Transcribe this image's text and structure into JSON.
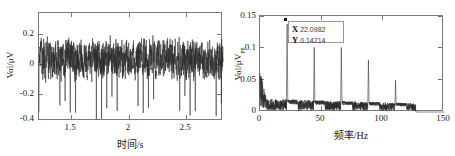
{
  "figure": {
    "background": "#ffffff",
    "trace_color": "#2b2b2b",
    "axis_color": "#7a7a7a"
  },
  "panels": [
    {
      "id": "time-domain",
      "xlabel": "时间/s",
      "ylabel": "Vol/μV",
      "ylabel_sub": "",
      "xticks": [
        "1.5",
        "2",
        "2.5"
      ],
      "yticks": [
        "0.2",
        "0",
        "-0.2",
        "-0.4"
      ]
    },
    {
      "id": "frequency-domain",
      "xlabel": "频率/Hz",
      "ylabel": "Vol/μV",
      "ylabel_sub": "pp",
      "xticks": [
        "0",
        "50",
        "100",
        "150"
      ],
      "yticks": [
        "0.15",
        "0.1",
        "0.05",
        "0"
      ]
    }
  ],
  "datatip": {
    "x_key": "X",
    "x_value": "22.0982",
    "y_key": "Y",
    "y_value": "0.14214"
  },
  "chart_data": [
    {
      "type": "line",
      "id": "time-domain",
      "title": "",
      "xlabel": "时间/s",
      "ylabel": "Vol/μV",
      "xlim": [
        1.22,
        2.82
      ],
      "ylim": [
        -0.42,
        0.31
      ],
      "xticks": [
        1.5,
        2,
        2.5
      ],
      "yticks": [
        0.2,
        0,
        -0.2,
        -0.4
      ],
      "grid": false,
      "legend": null,
      "description": "Broadband random noise about 0 μV with amplitude roughly ±0.15 μV, punctuated by periodic large negative impulses reaching about -0.40 μV spaced about 0.045 s apart (≈ 22 Hz repetition rate).",
      "series": [
        {
          "name": "Vol",
          "sampling_note": "noise envelope ±0.15 with periodic negative spikes to -0.40",
          "spike_period_s": 0.0453,
          "spike_amplitude": -0.4,
          "noise_amplitude": 0.15
        }
      ]
    },
    {
      "type": "line",
      "id": "frequency-domain",
      "title": "",
      "xlabel": "频率/Hz",
      "ylabel": "Vol/μVpp",
      "xlim": [
        0,
        150
      ],
      "ylim": [
        0,
        0.155
      ],
      "xticks": [
        0,
        50,
        100,
        150
      ],
      "yticks": [
        0,
        0.05,
        0.1,
        0.15
      ],
      "grid": false,
      "legend": null,
      "description": "Amplitude spectrum with a noise floor near 0.01 and a harmonic family at multiples of about 22 Hz. Spectrum data ends near 127 Hz.",
      "noise_floor": 0.012,
      "data_end_hz": 127,
      "peaks": [
        {
          "freq": 22.0982,
          "amp": 0.14214,
          "label": "fundamental"
        },
        {
          "freq": 44.2,
          "amp": 0.105,
          "label": "2nd harmonic"
        },
        {
          "freq": 66.3,
          "amp": 0.105,
          "label": "3rd harmonic"
        },
        {
          "freq": 88.4,
          "amp": 0.085,
          "label": "4th harmonic"
        },
        {
          "freq": 110.5,
          "amp": 0.052,
          "label": "5th harmonic"
        }
      ],
      "annotations": [
        {
          "type": "datatip",
          "x": 22.0982,
          "y": 0.14214,
          "text": "X 22.0982 / Y 0.14214"
        }
      ]
    }
  ]
}
